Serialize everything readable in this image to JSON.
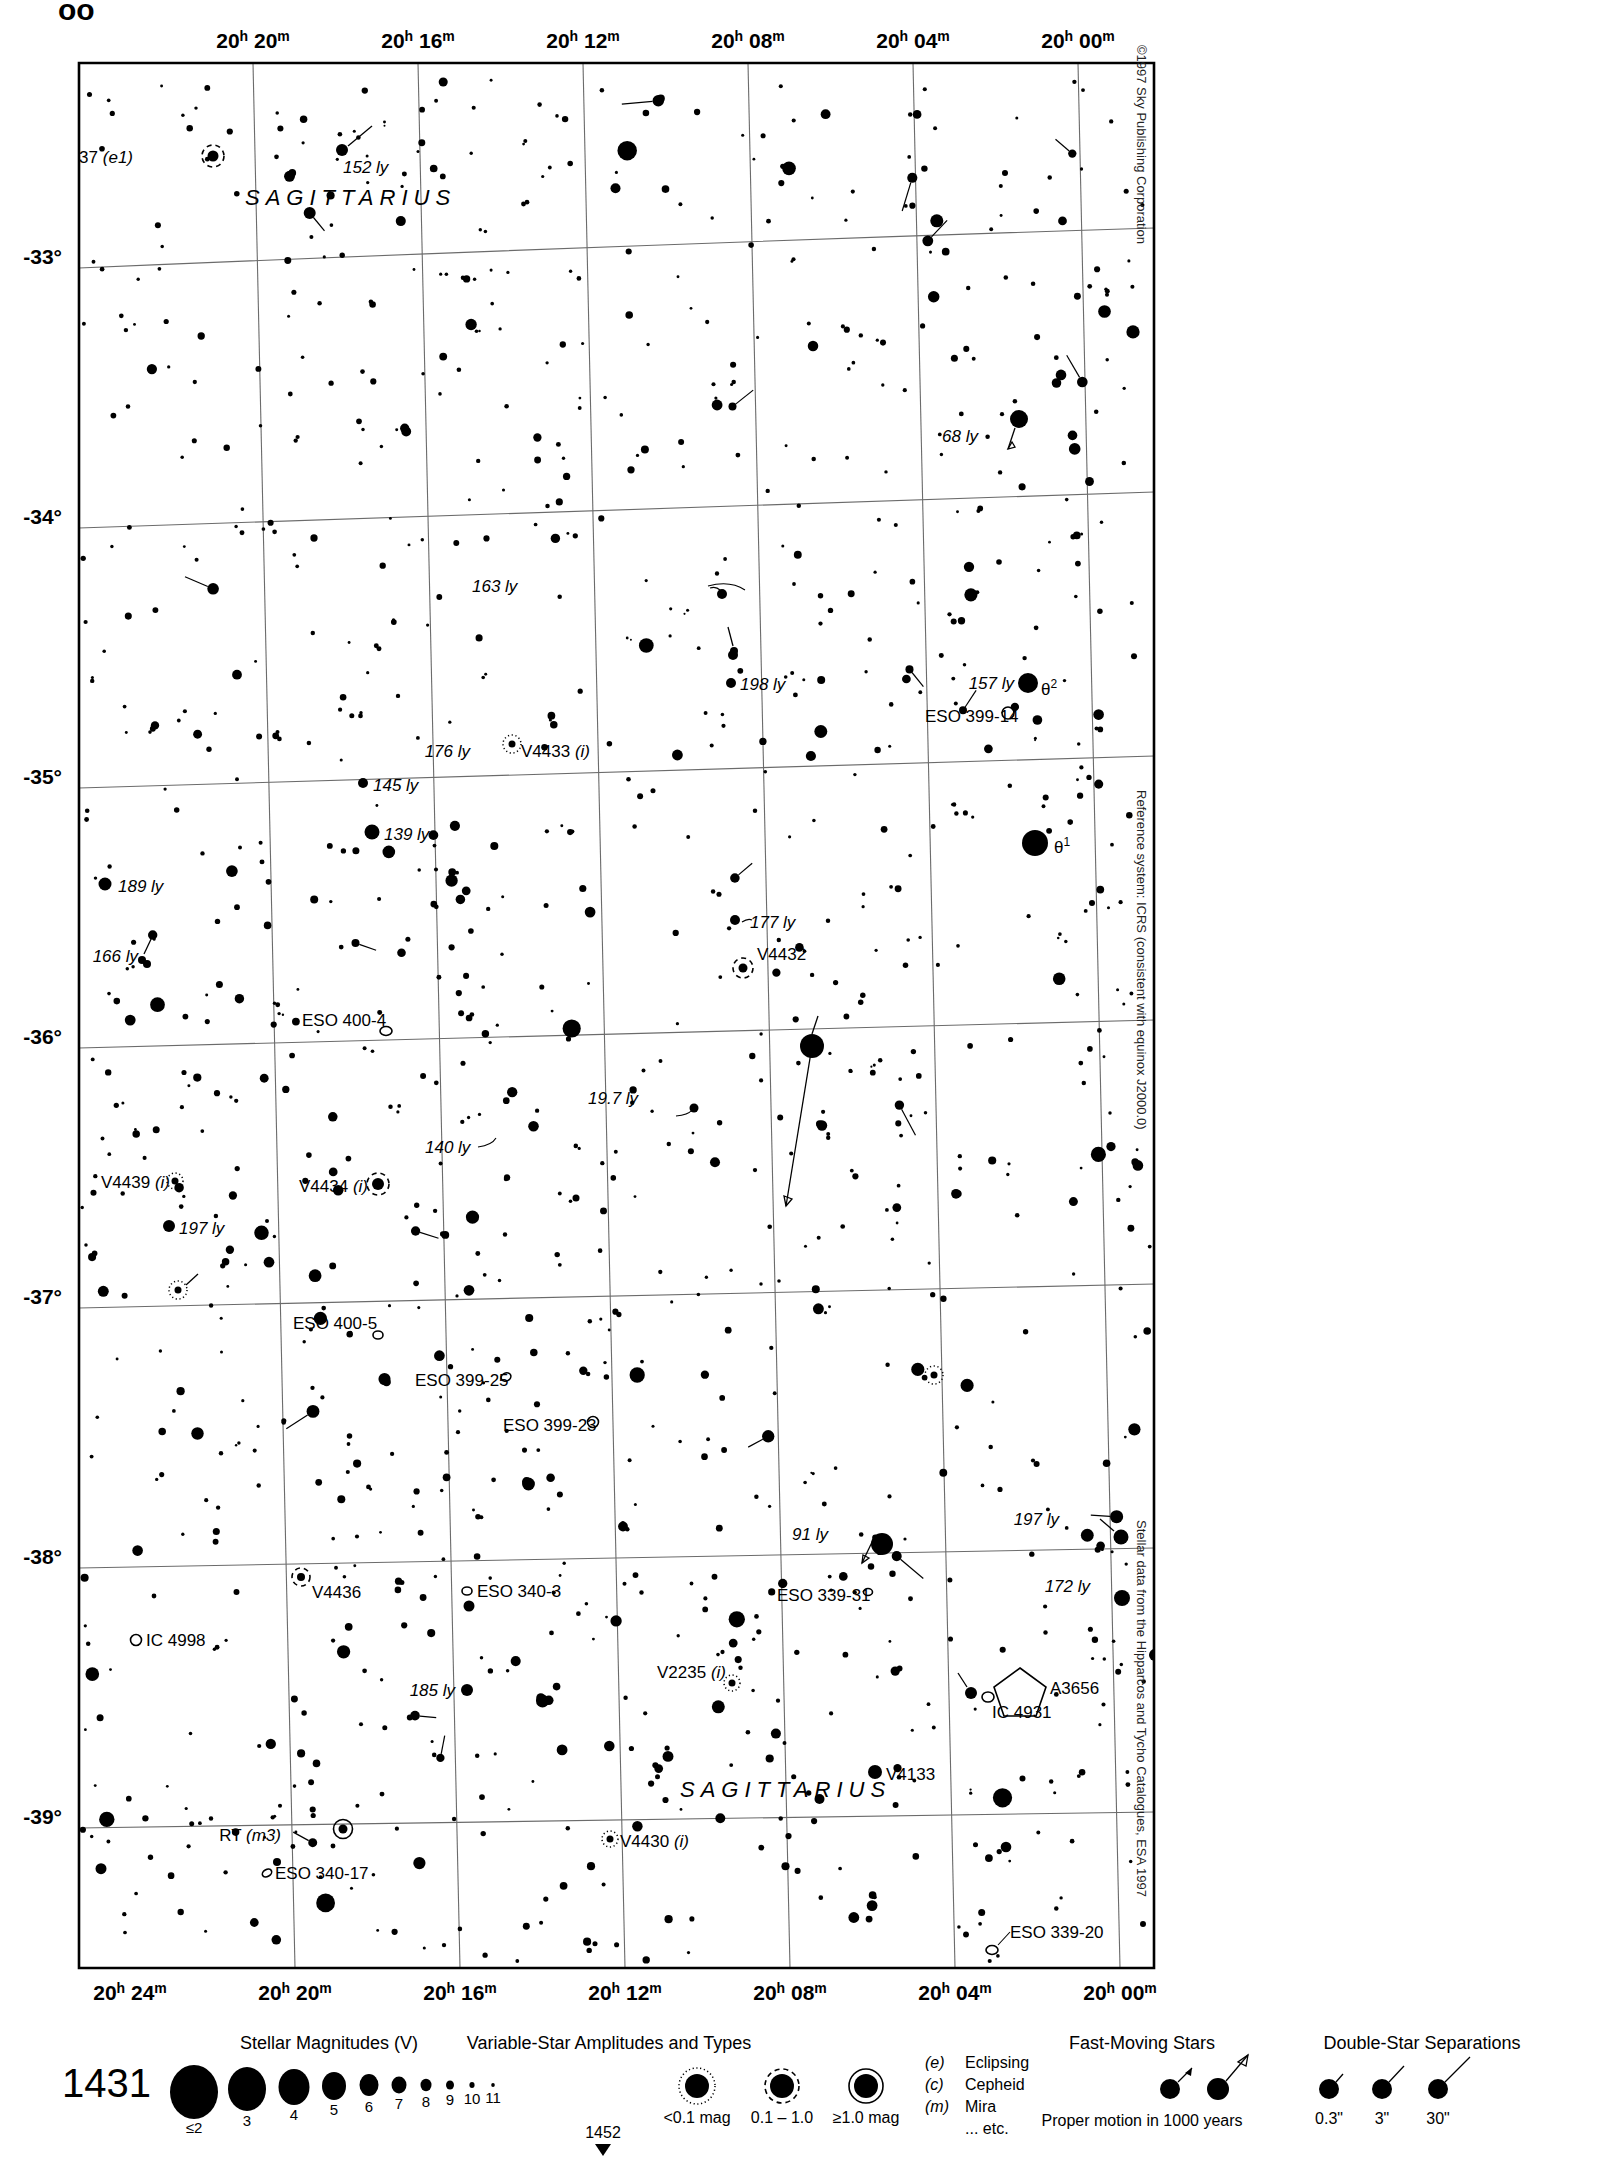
{
  "page": {
    "top_partial_text": "ᴏᴏ",
    "chart_number": "1431",
    "adjacent_chart_below": "1452"
  },
  "credits": {
    "copyright": "©1997 Sky Publishing Corporation",
    "reference_system": "Reference system: ICRS (consistent with equinox J2000.0)",
    "data_source": "Stellar data from the Hipparcos and Tycho Catalogues, ESA 1997"
  },
  "chart_data": {
    "type": "scatter",
    "xlabel": "Right Ascension",
    "ylabel": "Declination",
    "grid": true,
    "xlim_ra": [
      "20h 24m",
      "19h 58m"
    ],
    "ylim_dec": [
      -39.4,
      -32.6
    ],
    "ra_ticks_top": [
      "20h 20m",
      "20h 16m",
      "20h 12m",
      "20h 08m",
      "20h 04m",
      "20h 00m"
    ],
    "ra_ticks_bottom": [
      "20h 24m",
      "20h 20m",
      "20h 16m",
      "20h 12m",
      "20h 08m",
      "20h 04m",
      "20h 00m"
    ],
    "dec_ticks": [
      "-33°",
      "-34°",
      "-35°",
      "-36°",
      "-37°",
      "-38°",
      "-39°"
    ],
    "constellation_labels": [
      {
        "name": "SAGITTARIUS",
        "x": 355,
        "y": 290
      },
      {
        "name": "SAGITTARIUS",
        "x": 1055,
        "y": 1822
      }
    ],
    "annotations": [
      {
        "label": "V4437 (e1)",
        "x": 135,
        "y": 162,
        "kind": "variable-star",
        "italic_part": "(e1)"
      },
      {
        "label": "152 ly",
        "x": 343,
        "y": 170,
        "kind": "distance"
      },
      {
        "label": "68 ly",
        "x": 982,
        "y": 435,
        "kind": "distance"
      },
      {
        "label": "163 ly",
        "x": 470,
        "y": 588,
        "kind": "distance"
      },
      {
        "label": "198 ly",
        "x": 738,
        "y": 688,
        "kind": "distance"
      },
      {
        "label": "157 ly",
        "x": 989,
        "y": 690,
        "kind": "distance"
      },
      {
        "label": "θ2",
        "x": 1440,
        "y": 693,
        "kind": "bayer"
      },
      {
        "label": "ESO 399-14",
        "x": 925,
        "y": 722,
        "kind": "galaxy"
      },
      {
        "label": "176 ly",
        "x": 472,
        "y": 752,
        "kind": "distance"
      },
      {
        "label": "V4433 (i)",
        "x": 520,
        "y": 753,
        "kind": "variable-star"
      },
      {
        "label": "145 ly",
        "x": 372,
        "y": 793,
        "kind": "distance"
      },
      {
        "label": "139 ly",
        "x": 383,
        "y": 840,
        "kind": "distance"
      },
      {
        "label": "θ1",
        "x": 1052,
        "y": 852,
        "kind": "bayer"
      },
      {
        "label": "189 ly",
        "x": 118,
        "y": 903,
        "kind": "distance"
      },
      {
        "label": "177 ly",
        "x": 748,
        "y": 932,
        "kind": "distance"
      },
      {
        "label": "166 ly",
        "x": 78,
        "y": 980,
        "kind": "distance"
      },
      {
        "label": "V4432",
        "x": 537,
        "y": 983,
        "kind": "variable-star"
      },
      {
        "label": "ESO 400-4",
        "x": 303,
        "y": 1027,
        "kind": "galaxy"
      },
      {
        "label": "19.7 ly",
        "x": 588,
        "y": 1105,
        "kind": "distance"
      },
      {
        "label": "140 ly",
        "x": 425,
        "y": 1155,
        "kind": "distance"
      },
      {
        "label": "V4439 (i)",
        "x": 105,
        "y": 1192,
        "kind": "variable-star"
      },
      {
        "label": "V4434 (i)",
        "x": 313,
        "y": 1204,
        "kind": "variable-star"
      },
      {
        "label": "197 ly",
        "x": 178,
        "y": 1237,
        "kind": "distance"
      },
      {
        "label": "ESO 400-5",
        "x": 293,
        "y": 1331,
        "kind": "galaxy"
      },
      {
        "label": "ESO 399-25",
        "x": 415,
        "y": 1388,
        "kind": "galaxy"
      },
      {
        "label": "ESO 399-23",
        "x": 503,
        "y": 1433,
        "kind": "galaxy"
      },
      {
        "label": "197 ly",
        "x": 1058,
        "y": 1527,
        "kind": "distance"
      },
      {
        "label": "91 ly",
        "x": 830,
        "y": 1549,
        "kind": "distance"
      },
      {
        "label": "172 ly",
        "x": 1089,
        "y": 1594,
        "kind": "distance"
      },
      {
        "label": "V4436",
        "x": 311,
        "y": 1598,
        "kind": "variable-star"
      },
      {
        "label": "ESO 340-3",
        "x": 477,
        "y": 1597,
        "kind": "galaxy"
      },
      {
        "label": "ESO 339-31",
        "x": 777,
        "y": 1603,
        "kind": "galaxy"
      },
      {
        "label": "IC 4998",
        "x": 145,
        "y": 1643,
        "kind": "galaxy"
      },
      {
        "label": "ESO 339-25",
        "x": 1161,
        "y": 1662,
        "kind": "galaxy"
      },
      {
        "label": "185 ly",
        "x": 398,
        "y": 1692,
        "kind": "distance"
      },
      {
        "label": "V2235 (i)",
        "x": 667,
        "y": 1678,
        "kind": "variable-star"
      },
      {
        "label": "A3656",
        "x": 1031,
        "y": 1693,
        "kind": "cluster"
      },
      {
        "label": "IC 4931",
        "x": 988,
        "y": 1718,
        "kind": "galaxy"
      },
      {
        "label": "V4133",
        "x": 886,
        "y": 1780,
        "kind": "variable-star"
      },
      {
        "label": "RT (m3)",
        "x": 281,
        "y": 1840,
        "kind": "variable-star"
      },
      {
        "label": "V4430 (i)",
        "x": 618,
        "y": 1847,
        "kind": "variable-star"
      },
      {
        "label": "ESO 340-17",
        "x": 274,
        "y": 1878,
        "kind": "galaxy"
      },
      {
        "label": "ESO 339-20",
        "x": 1008,
        "y": 1940,
        "kind": "galaxy"
      }
    ]
  },
  "legend": {
    "magnitudes": {
      "title": "Stellar Magnitudes (V)",
      "values": [
        "≤2",
        "3",
        "4",
        "5",
        "6",
        "7",
        "8",
        "9",
        "10",
        "11"
      ]
    },
    "variables": {
      "title": "Variable-Star Amplitudes and Types",
      "amplitude_labels": [
        "<0.1 mag",
        "0.1 – 1.0",
        "≥1.0 mag"
      ],
      "types": [
        {
          "code": "(e)",
          "name": "Eclipsing"
        },
        {
          "code": "(c)",
          "name": "Cepheid"
        },
        {
          "code": "(m)",
          "name": "Mira"
        },
        {
          "code": "",
          "name": "... etc."
        }
      ]
    },
    "fast_moving": {
      "title": "Fast-Moving Stars",
      "caption": "Proper motion in 1000 years"
    },
    "doubles": {
      "title": "Double-Star Separations",
      "values": [
        "0.3\"",
        "3\"",
        "30\""
      ]
    }
  }
}
